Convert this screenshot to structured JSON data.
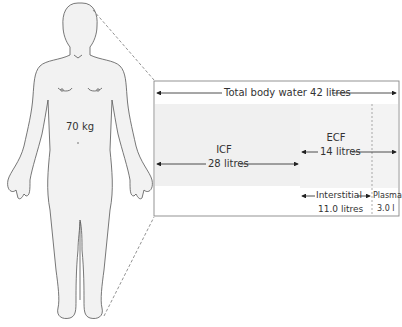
{
  "figure": {
    "body_weight_label": "70 kg",
    "total": {
      "label": "Total body water 42 litres"
    },
    "icf": {
      "name": "ICF",
      "volume": "28 litres"
    },
    "ecf": {
      "name": "ECF",
      "volume": "14 litres"
    },
    "interstitial": {
      "name": "Interstitial",
      "volume": "11.0 litres"
    },
    "plasma": {
      "name": "Plasma",
      "volume": "3.0 l"
    },
    "colors": {
      "outline": "#555555",
      "skin": "#f2f2f2",
      "shade": "#efefef",
      "box_border": "#888888"
    }
  }
}
